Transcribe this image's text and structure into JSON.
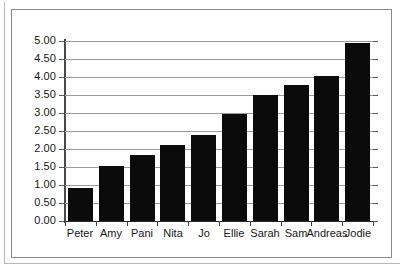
{
  "chart_data": {
    "type": "bar",
    "title": "",
    "subtitle": "",
    "xlabel": "",
    "ylabel": "",
    "categories": [
      "Peter",
      "Amy",
      "Pani",
      "Nita",
      "Jo",
      "Ellie",
      "Sarah",
      "Sam",
      "Andreas",
      "Jodie"
    ],
    "values": [
      0.92,
      1.52,
      1.83,
      2.11,
      2.38,
      2.98,
      3.51,
      3.78,
      4.03,
      4.95
    ],
    "series": [
      {
        "name": "",
        "values": [
          0.92,
          1.52,
          1.83,
          2.11,
          2.38,
          2.98,
          3.51,
          3.78,
          4.03,
          4.95
        ]
      }
    ],
    "ylim": [
      0.0,
      5.0
    ],
    "ytick_step": 0.5,
    "ytick_labels": [
      "5.00",
      "4.50",
      "4.00",
      "3.50",
      "3.00",
      "2.50",
      "2.00",
      "1.50",
      "1.00",
      "0.50",
      "0.00"
    ],
    "ytick_values": [
      5.0,
      4.5,
      4.0,
      3.5,
      3.0,
      2.5,
      2.0,
      1.5,
      1.0,
      0.5,
      0.0
    ],
    "grid": true,
    "grid_axis": "y",
    "legend": false,
    "legend_position": "none",
    "bar_color": "#0b0b0b",
    "gridline_color": "#9a9a9a",
    "axis_color": "#4a4a4a",
    "background_color": "#ffffff",
    "frame": true
  }
}
